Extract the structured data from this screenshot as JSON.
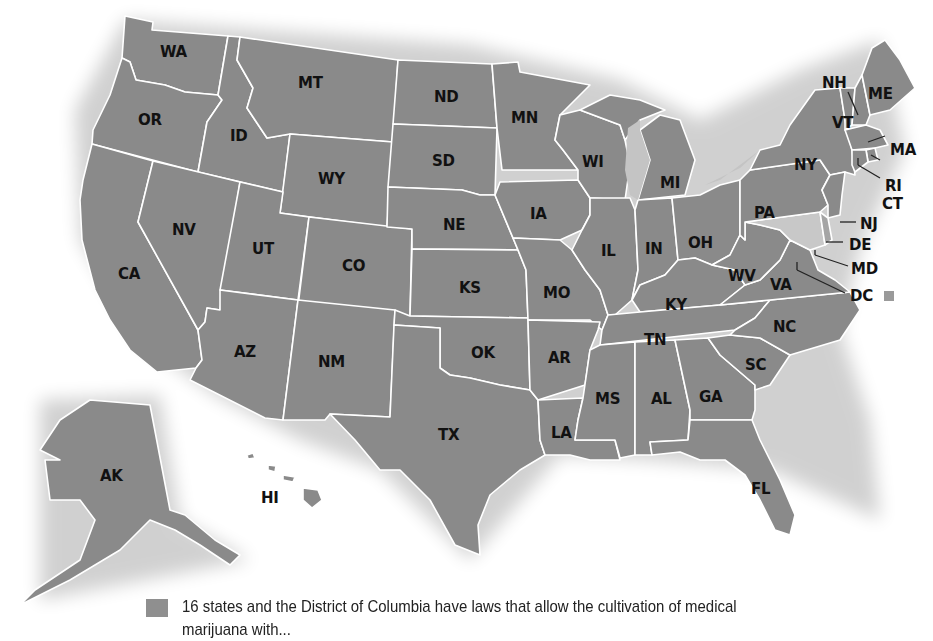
{
  "map": {
    "title_fragment": "y",
    "fill_color": "#8a8a8a",
    "border_color": "#ffffff",
    "lake_color": "#c4c4c4",
    "highlight_light_color": "#c8c8c8",
    "labels": {
      "WA": "WA",
      "OR": "OR",
      "CA": "CA",
      "ID": "ID",
      "NV": "NV",
      "MT": "MT",
      "WY": "WY",
      "UT": "UT",
      "CO": "CO",
      "AZ": "AZ",
      "NM": "NM",
      "ND": "ND",
      "SD": "SD",
      "NE": "NE",
      "KS": "KS",
      "OK": "OK",
      "TX": "TX",
      "MN": "MN",
      "IA": "IA",
      "MO": "MO",
      "AR": "AR",
      "LA": "LA",
      "WI": "WI",
      "IL": "IL",
      "MI": "MI",
      "IN": "IN",
      "OH": "OH",
      "KY": "KY",
      "TN": "TN",
      "MS": "MS",
      "AL": "AL",
      "GA": "GA",
      "FL": "FL",
      "SC": "SC",
      "NC": "NC",
      "VA": "VA",
      "WV": "WV",
      "PA": "PA",
      "NY": "NY",
      "VT": "VT",
      "NH": "NH",
      "ME": "ME",
      "MA": "MA",
      "RI": "RI",
      "CT": "CT",
      "NJ": "NJ",
      "DE": "DE",
      "MD": "MD",
      "DC": "DC",
      "AK": "AK",
      "HI": "HI"
    }
  },
  "legend": {
    "swatch_color": "#8f8f8f",
    "text_line1": "16 states and the District of Columbia have laws that allow the cultivation of medical",
    "text_line2": "marijuana with..."
  }
}
